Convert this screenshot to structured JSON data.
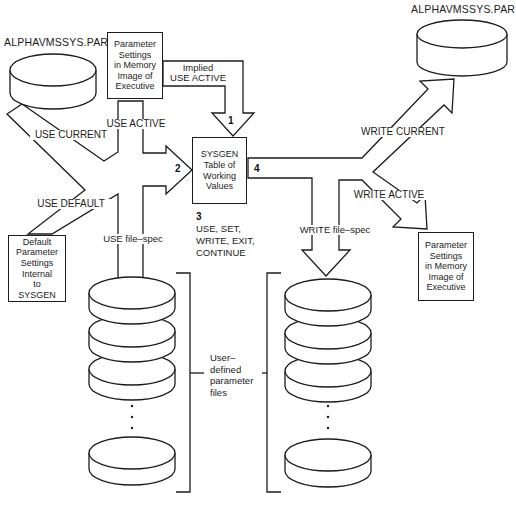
{
  "titles": {
    "disk_top_left": "ALPHAVMSSYS.PAR",
    "disk_top_right": "ALPHAVMSSYS.PAR"
  },
  "labels": {
    "use_current": "USE CURRENT",
    "use_active": "USE ACTIVE",
    "implied_line1": "Implied",
    "implied_line2": "USE ACTIVE",
    "use_default": "USE DEFAULT",
    "use_file_spec": "USE file–spec",
    "write_current": "WRITE CURRENT",
    "write_active": "WRITE ACTIVE",
    "write_file_spec": "WRITE file–spec",
    "step1": "1",
    "step2": "2",
    "step3": "3",
    "step4": "4",
    "commands": [
      "USE, SET,",
      "WRITE, EXIT,",
      "CONTINUE"
    ]
  },
  "boxes": {
    "memory_top": {
      "lines": [
        "Parameter",
        "Settings",
        "in Memory",
        "Image of",
        "Executive"
      ]
    },
    "sysgen": {
      "lines": [
        "SYSGEN",
        "Table of",
        "Working",
        "Values"
      ]
    },
    "default_box": {
      "lines": [
        "Default",
        "Parameter",
        "Settings",
        "Internal",
        "to",
        "SYSGEN"
      ]
    },
    "memory_right": {
      "lines": [
        "Parameter",
        "Settings",
        "in Memory",
        "Image of",
        "Executive"
      ]
    }
  },
  "stack_label": {
    "lines": [
      "User–",
      "defined",
      "parameter",
      "files"
    ]
  },
  "colors": {
    "line": "#1c1c1c",
    "background": "#ffffff"
  }
}
